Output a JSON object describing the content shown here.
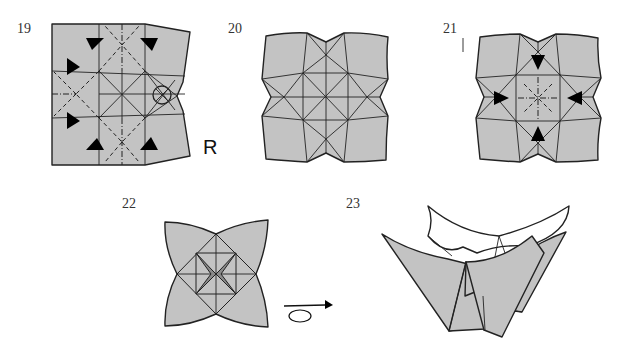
{
  "colors": {
    "paper": "#c3c3c3",
    "line": "#222222",
    "white": "#ffffff"
  },
  "steps": [
    {
      "number": "19",
      "annotation": "R",
      "symbols": [
        "valley-fold-lines",
        "mountain-fold-lines",
        "push-arrows",
        "rotate-circle-symbol"
      ]
    },
    {
      "number": "20",
      "symbols": []
    },
    {
      "number": "21",
      "symbols": [
        "push-arrows",
        "mountain-fold-lines",
        "valley-fold-lines"
      ]
    },
    {
      "number": "22",
      "symbols": [
        "turn-over-symbol"
      ]
    },
    {
      "number": "23",
      "symbols": []
    }
  ]
}
